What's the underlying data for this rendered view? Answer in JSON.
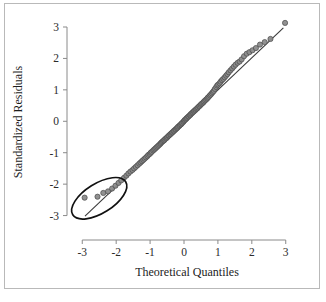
{
  "figure": {
    "border_color": "#b9b9b9",
    "background": "#ffffff"
  },
  "chart_data": {
    "type": "scatter",
    "title": "",
    "subtitle": "",
    "xlabel": "Theoretical Quantiles",
    "ylabel": "Standardized Residuals",
    "xlim": [
      -3.45,
      3.45
    ],
    "ylim": [
      -3.3,
      3.35
    ],
    "xticks": [
      -3,
      -2,
      -1,
      0,
      1,
      2,
      3
    ],
    "xticklabels": [
      "-3",
      "-2",
      "-1",
      "0",
      "1",
      "2",
      "3"
    ],
    "yticks": [
      -3,
      -2,
      -1,
      0,
      1,
      2,
      3
    ],
    "yticklabels": [
      "-3",
      "-2",
      "-1",
      "0",
      "1",
      "2",
      "3"
    ],
    "grid": false,
    "legend": null,
    "point_color": "#8b8b8b",
    "point_edge_color": "#4a4a4a",
    "point_radius": 2.6,
    "reference_line": {
      "name": "normal-reference-line",
      "color": "#3a3a3a",
      "x_start": -2.92,
      "y_start": -3.02,
      "x_end": 2.93,
      "y_end": 2.97
    },
    "annotations": [
      {
        "name": "outlier-ellipse",
        "type": "ellipse",
        "center_x": -2.5,
        "center_y": -2.45,
        "radius_x": 0.92,
        "radius_y": 0.47,
        "rotation_deg": -32,
        "color": "#111111",
        "description": "ellipse highlighting lower-tail outliers"
      }
    ],
    "series": [
      {
        "name": "standardized residuals",
        "x": [
          -2.93,
          -2.55,
          -2.38,
          -2.24,
          -2.12,
          -2.02,
          -1.93,
          -1.85,
          -1.77,
          -1.7,
          -1.64,
          -1.58,
          -1.52,
          -1.47,
          -1.42,
          -1.37,
          -1.32,
          -1.28,
          -1.24,
          -1.2,
          -1.16,
          -1.12,
          -1.08,
          -1.05,
          -1.01,
          -0.98,
          -0.95,
          -0.91,
          -0.88,
          -0.85,
          -0.82,
          -0.79,
          -0.76,
          -0.73,
          -0.7,
          -0.68,
          -0.65,
          -0.62,
          -0.59,
          -0.57,
          -0.54,
          -0.51,
          -0.49,
          -0.46,
          -0.44,
          -0.41,
          -0.39,
          -0.36,
          -0.34,
          -0.31,
          -0.29,
          -0.26,
          -0.24,
          -0.21,
          -0.19,
          -0.17,
          -0.14,
          -0.12,
          -0.09,
          -0.07,
          -0.05,
          -0.02,
          0.0,
          0.02,
          0.05,
          0.07,
          0.09,
          0.12,
          0.14,
          0.17,
          0.19,
          0.21,
          0.24,
          0.26,
          0.29,
          0.31,
          0.34,
          0.36,
          0.39,
          0.41,
          0.44,
          0.46,
          0.49,
          0.51,
          0.54,
          0.57,
          0.59,
          0.62,
          0.65,
          0.68,
          0.7,
          0.73,
          0.76,
          0.79,
          0.82,
          0.85,
          0.88,
          0.91,
          0.95,
          0.98,
          1.01,
          1.05,
          1.08,
          1.12,
          1.16,
          1.2,
          1.24,
          1.28,
          1.32,
          1.37,
          1.42,
          1.47,
          1.52,
          1.58,
          1.64,
          1.7,
          1.77,
          1.85,
          1.93,
          2.02,
          2.12,
          2.24,
          2.38,
          2.55,
          2.98
        ],
        "y": [
          -2.43,
          -2.4,
          -2.28,
          -2.23,
          -2.14,
          -2.05,
          -1.96,
          -1.88,
          -1.8,
          -1.73,
          -1.66,
          -1.6,
          -1.55,
          -1.5,
          -1.45,
          -1.4,
          -1.35,
          -1.31,
          -1.27,
          -1.23,
          -1.19,
          -1.15,
          -1.11,
          -1.07,
          -1.04,
          -1.0,
          -0.97,
          -0.93,
          -0.9,
          -0.87,
          -0.84,
          -0.81,
          -0.78,
          -0.75,
          -0.72,
          -0.69,
          -0.66,
          -0.63,
          -0.61,
          -0.58,
          -0.55,
          -0.53,
          -0.5,
          -0.47,
          -0.45,
          -0.42,
          -0.4,
          -0.37,
          -0.35,
          -0.32,
          -0.3,
          -0.27,
          -0.25,
          -0.22,
          -0.2,
          -0.17,
          -0.15,
          -0.12,
          -0.1,
          -0.07,
          -0.05,
          -0.02,
          0.01,
          0.04,
          0.06,
          0.09,
          0.11,
          0.14,
          0.16,
          0.19,
          0.21,
          0.24,
          0.26,
          0.29,
          0.31,
          0.34,
          0.36,
          0.39,
          0.41,
          0.44,
          0.47,
          0.49,
          0.52,
          0.55,
          0.57,
          0.6,
          0.63,
          0.66,
          0.69,
          0.72,
          0.75,
          0.78,
          0.82,
          0.85,
          0.89,
          0.93,
          0.97,
          1.03,
          1.09,
          1.14,
          1.17,
          1.21,
          1.26,
          1.31,
          1.35,
          1.4,
          1.45,
          1.5,
          1.56,
          1.62,
          1.68,
          1.74,
          1.8,
          1.86,
          1.9,
          1.97,
          2.07,
          2.15,
          2.2,
          2.26,
          2.33,
          2.44,
          2.52,
          2.62,
          3.13
        ]
      }
    ]
  }
}
